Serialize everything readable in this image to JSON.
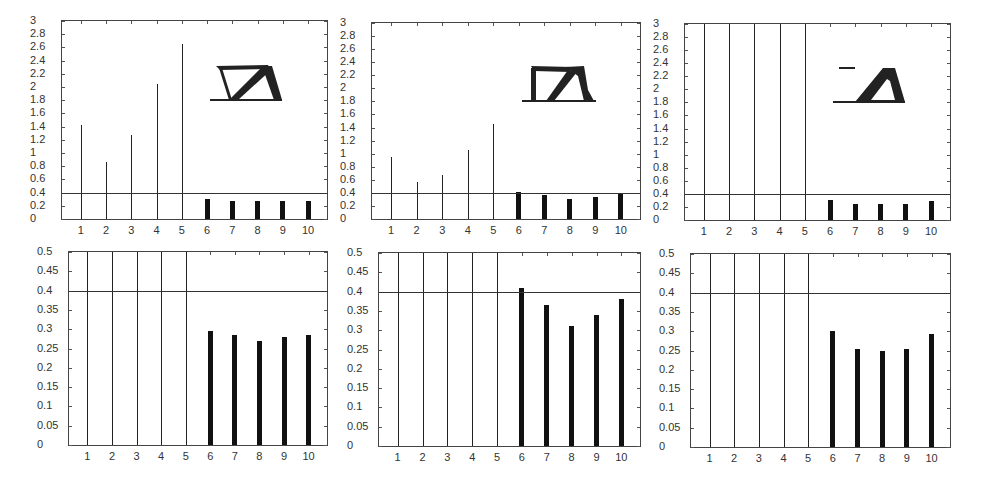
{
  "chart_data": [
    {
      "id": "top-left",
      "type": "bar",
      "title": "",
      "xlabel": "",
      "ylabel": "",
      "categories": [
        "1",
        "2",
        "3",
        "4",
        "5",
        "6",
        "7",
        "8",
        "9",
        "10"
      ],
      "values": [
        1.43,
        0.87,
        1.28,
        2.05,
        2.65,
        0.3,
        0.28,
        0.27,
        0.28,
        0.28
      ],
      "ylim": [
        0,
        3
      ],
      "yticks": [
        "0",
        "0.2",
        "0.4",
        "0.6",
        "0.8",
        "1",
        "1.2",
        "1.4",
        "1.6",
        "1.8",
        "2",
        "2.2",
        "2.4",
        "2.6",
        "2.8",
        "3"
      ],
      "threshold": 0.4,
      "grid": false,
      "inset": "truss-topology-1"
    },
    {
      "id": "top-middle",
      "type": "bar",
      "title": "",
      "xlabel": "",
      "ylabel": "",
      "categories": [
        "1",
        "2",
        "3",
        "4",
        "5",
        "6",
        "7",
        "8",
        "9",
        "10"
      ],
      "values": [
        0.95,
        0.57,
        0.67,
        1.06,
        1.46,
        0.41,
        0.36,
        0.31,
        0.34,
        0.38
      ],
      "ylim": [
        0,
        3
      ],
      "yticks": [
        "0",
        "0.2",
        "0.4",
        "0.6",
        "0.8",
        "1",
        "1.2",
        "1.4",
        "1.6",
        "1.8",
        "2",
        "2.2",
        "2.4",
        "2.6",
        "2.8",
        "3"
      ],
      "threshold": 0.4,
      "grid": false,
      "inset": "truss-topology-2"
    },
    {
      "id": "top-right",
      "type": "bar",
      "title": "",
      "xlabel": "",
      "ylabel": "",
      "categories": [
        "1",
        "2",
        "3",
        "4",
        "5",
        "6",
        "7",
        "8",
        "9",
        "10"
      ],
      "values": [
        3.0,
        3.0,
        3.0,
        3.0,
        3.0,
        0.3,
        0.25,
        0.25,
        0.25,
        0.29
      ],
      "ylim": [
        0,
        3
      ],
      "yticks": [
        "0",
        "0.2",
        "0.4",
        "0.6",
        "0.8",
        "1",
        "1.2",
        "1.4",
        "1.6",
        "1.8",
        "2",
        "2.2",
        "2.4",
        "2.6",
        "2.8",
        "3"
      ],
      "threshold": 0.4,
      "grid": false,
      "inset": "truss-topology-3"
    },
    {
      "id": "bottom-left",
      "type": "bar",
      "title": "",
      "xlabel": "",
      "ylabel": "",
      "categories": [
        "1",
        "2",
        "3",
        "4",
        "5",
        "6",
        "7",
        "8",
        "9",
        "10"
      ],
      "values": [
        0.5,
        0.5,
        0.5,
        0.5,
        0.5,
        0.296,
        0.285,
        0.27,
        0.28,
        0.286
      ],
      "ylim": [
        0,
        0.5
      ],
      "yticks": [
        "0",
        "0.05",
        "0.1",
        "0.15",
        "0.2",
        "0.25",
        "0.3",
        "0.35",
        "0.4",
        "0.45",
        "0.5"
      ],
      "threshold": 0.4,
      "grid": false
    },
    {
      "id": "bottom-middle",
      "type": "bar",
      "title": "",
      "xlabel": "",
      "ylabel": "",
      "categories": [
        "1",
        "2",
        "3",
        "4",
        "5",
        "6",
        "7",
        "8",
        "9",
        "10"
      ],
      "values": [
        0.5,
        0.5,
        0.5,
        0.5,
        0.5,
        0.41,
        0.364,
        0.312,
        0.34,
        0.38
      ],
      "ylim": [
        0,
        0.5
      ],
      "yticks": [
        "0",
        "0.05",
        "0.1",
        "0.15",
        "0.2",
        "0.25",
        "0.3",
        "0.35",
        "0.4",
        "0.45",
        "0.5"
      ],
      "threshold": 0.4,
      "grid": false
    },
    {
      "id": "bottom-right",
      "type": "bar",
      "title": "",
      "xlabel": "",
      "ylabel": "",
      "categories": [
        "1",
        "2",
        "3",
        "4",
        "5",
        "6",
        "7",
        "8",
        "9",
        "10"
      ],
      "values": [
        0.5,
        0.5,
        0.5,
        0.5,
        0.5,
        0.3,
        0.255,
        0.25,
        0.254,
        0.293
      ],
      "ylim": [
        0,
        0.5
      ],
      "yticks": [
        "0",
        "0.05",
        "0.1",
        "0.15",
        "0.2",
        "0.25",
        "0.3",
        "0.35",
        "0.4",
        "0.45",
        "0.5"
      ],
      "threshold": 0.4,
      "grid": false
    }
  ],
  "layout": {
    "panels": [
      {
        "left": 61,
        "top": 20,
        "width": 267,
        "height": 200
      },
      {
        "left": 371,
        "top": 22,
        "width": 270,
        "height": 198
      },
      {
        "left": 684,
        "top": 23,
        "width": 267,
        "height": 198
      },
      {
        "left": 68,
        "top": 251,
        "width": 260,
        "height": 195
      },
      {
        "left": 378,
        "top": 252,
        "width": 263,
        "height": 195
      },
      {
        "left": 690,
        "top": 253,
        "width": 261,
        "height": 195
      }
    ]
  },
  "colors": {
    "stem": "#222222",
    "bar": "#111111",
    "axis": "#444444",
    "threshold": "#333333"
  }
}
